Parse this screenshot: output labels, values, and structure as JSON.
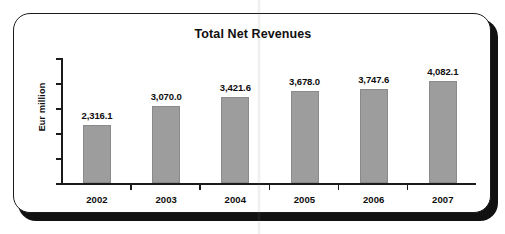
{
  "chart_data": {
    "type": "bar",
    "title": "Total Net Revenues",
    "xlabel": "",
    "ylabel": "Eur million",
    "categories": [
      "2002",
      "2003",
      "2004",
      "2005",
      "2006",
      "2007"
    ],
    "values": [
      2316.1,
      3070.0,
      3421.6,
      3678.0,
      3747.6,
      4082.1
    ],
    "value_labels": [
      "2,316.1",
      "3,070.0",
      "3,421.6",
      "3,678.0",
      "3,747.6",
      "4,082.1"
    ],
    "ylim": [
      0,
      5000
    ],
    "y_tick_count": 6,
    "y_tick_labels": [],
    "grid": false,
    "legend": false,
    "bar_color": "#9d9d9d",
    "axis_color": "#1b1b1b",
    "text_color": "#0d0d0d",
    "frame_color": "#1b1b1b",
    "background": "#ffffff"
  }
}
